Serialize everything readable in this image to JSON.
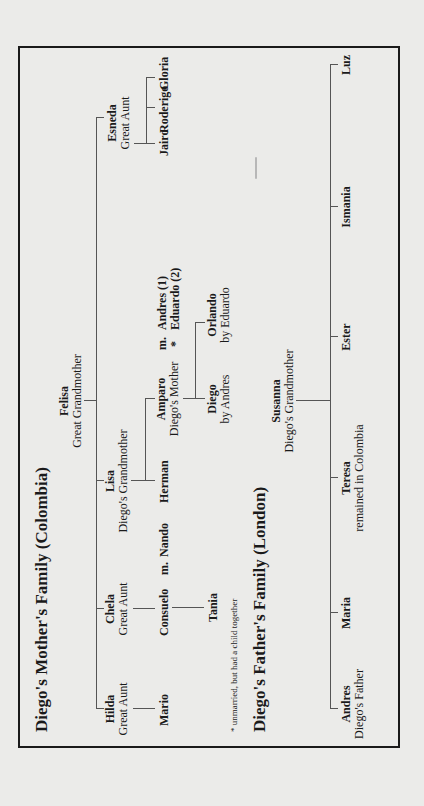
{
  "mother_family": {
    "title": "Diego's Mother's Family (Colombia)",
    "root": {
      "name": "Felisa",
      "role": "Great Grandmother"
    },
    "children": [
      {
        "name": "Hilda",
        "role": "Great Aunt"
      },
      {
        "name": "Chela",
        "role": "Great Aunt"
      },
      {
        "name": "Lisa",
        "role": "Diego's Grandmother"
      },
      {
        "name": "Esneda",
        "role": "Great Aunt"
      }
    ],
    "hilda_children": [
      {
        "name": "Mario"
      }
    ],
    "chela_children": [
      {
        "name": "Consuelo",
        "married_marker": "m.",
        "spouse": "Nando"
      }
    ],
    "consuelo_children": [
      {
        "name": "Tania"
      }
    ],
    "lisa_children": [
      {
        "name": "Herman"
      },
      {
        "name": "Amparo",
        "role": "Diego's Mother",
        "married_marker": "m.",
        "unmarried_marker": "*",
        "spouse1": "Andres (1)",
        "spouse2": "Eduardo (2)"
      }
    ],
    "amparo_children": [
      {
        "name": "Diego",
        "role": "by Andres"
      },
      {
        "name": "Orlando",
        "role": "by Eduardo"
      }
    ],
    "esneda_children": [
      {
        "name": "Jairo"
      },
      {
        "name": "Roderigo"
      },
      {
        "name": "Gloria"
      }
    ],
    "footnote": "* unmarried, but had a child together"
  },
  "father_family": {
    "title": "Diego's Father's Family (London)",
    "root": {
      "name": "Susanna",
      "role": "Diego's Grandmother"
    },
    "children": [
      {
        "name": "Andres",
        "role": "Diego's Father"
      },
      {
        "name": "Maria",
        "role": ""
      },
      {
        "name": "Teresa",
        "role": "remained in Colombia"
      },
      {
        "name": "Ester",
        "role": ""
      },
      {
        "name": "Ismania",
        "role": ""
      },
      {
        "name": "Luz",
        "role": ""
      }
    ]
  }
}
